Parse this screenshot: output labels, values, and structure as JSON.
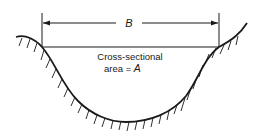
{
  "diagram": {
    "type": "channel-cross-section",
    "width_label": "B",
    "area_label_line1": "Cross-sectional",
    "area_label_prefix": "area = ",
    "area_symbol": "A",
    "colors": {
      "stroke": "#1a1a1a",
      "background": "#ffffff"
    }
  }
}
